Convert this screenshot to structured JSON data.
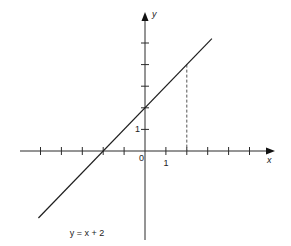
{
  "chart_data": {
    "type": "line",
    "title": "",
    "xlabel": "x",
    "ylabel": "y",
    "origin_label": "0",
    "x_range": [
      -5,
      5.5
    ],
    "y_range": [
      -4.5,
      5
    ],
    "x_ticks": [
      -5,
      -4,
      -3,
      -2,
      -1,
      1,
      2,
      3,
      4,
      5
    ],
    "y_ticks": [
      1,
      2,
      3,
      4,
      5
    ],
    "x_tick_labels": [
      {
        "value": 1,
        "text": "1"
      }
    ],
    "y_tick_labels": [
      {
        "value": 1,
        "text": "1"
      }
    ],
    "series": [
      {
        "name": "y = x + 2",
        "slope": 1,
        "intercept": 2,
        "x_start": -5.1,
        "x_end": 3.2
      }
    ],
    "annotation": {
      "text": "y = x + 2",
      "anchor_x": -3.6,
      "anchor_y": -3.8
    },
    "guides": [
      {
        "type": "vertical-dashed",
        "x": 2,
        "y_from": 0,
        "y_to": 4
      }
    ],
    "grid": false,
    "legend": "none"
  }
}
